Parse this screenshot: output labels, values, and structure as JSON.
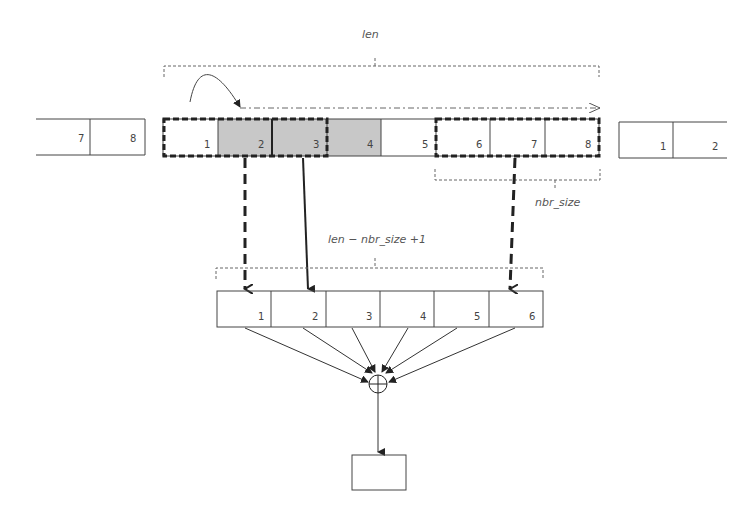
{
  "labels": {
    "len": "len",
    "nbr_size": "nbr_size",
    "output_count": "len − nbr_size +1"
  },
  "left_wrap": {
    "cells": [
      "7",
      "8"
    ]
  },
  "input_row": {
    "cells": [
      {
        "label": "1",
        "shaded": false
      },
      {
        "label": "2",
        "shaded": true
      },
      {
        "label": "3",
        "shaded": true
      },
      {
        "label": "4",
        "shaded": true
      },
      {
        "label": "5",
        "shaded": false
      },
      {
        "label": "6",
        "shaded": false
      },
      {
        "label": "7",
        "shaded": false
      },
      {
        "label": "8",
        "shaded": false
      }
    ]
  },
  "right_wrap": {
    "cells": [
      "1",
      "2"
    ]
  },
  "output_row": {
    "cells": [
      "1",
      "2",
      "3",
      "4",
      "5",
      "6"
    ]
  },
  "operator": "sum",
  "colors": {
    "shade": "#c8c8c8",
    "line": "#333333",
    "guide": "#666666"
  }
}
